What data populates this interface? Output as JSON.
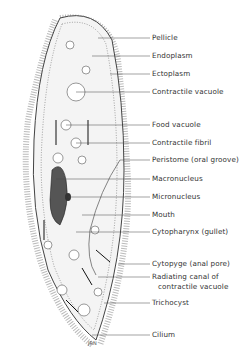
{
  "diagram": {
    "signature": "JRN",
    "labels": [
      {
        "text": "Pellicle",
        "y": 38,
        "tx": 98
      },
      {
        "text": "Endoplasm",
        "y": 56,
        "tx": 92
      },
      {
        "text": "Ectoplasm",
        "y": 74,
        "tx": 110
      },
      {
        "text": "Contractile vacuole",
        "y": 92,
        "tx": 76
      },
      {
        "text": "Food vacuole",
        "y": 125,
        "tx": 66
      },
      {
        "text": "Contractile fibril",
        "y": 143,
        "tx": 76
      },
      {
        "text": "Peristome (oral groove)",
        "y": 160,
        "tx": 120
      },
      {
        "text": "Macronucleus",
        "y": 179,
        "tx": 56
      },
      {
        "text": "Micronucleus",
        "y": 197,
        "tx": 68
      },
      {
        "text": "Mouth",
        "y": 215,
        "tx": 82
      },
      {
        "text": "Cytopharynx (gullet)",
        "y": 232,
        "tx": 76
      },
      {
        "text": "Cytopyge (anal pore)",
        "y": 264,
        "tx": 118
      },
      {
        "text": "Radiating canal of",
        "y": 277,
        "tx": 98
      },
      {
        "text": "contractile vacuole",
        "y": 287,
        "tx": -1
      },
      {
        "text": "Trichocyst",
        "y": 303,
        "tx": 104
      },
      {
        "text": "Cilium",
        "y": 335,
        "tx": 92
      }
    ]
  }
}
